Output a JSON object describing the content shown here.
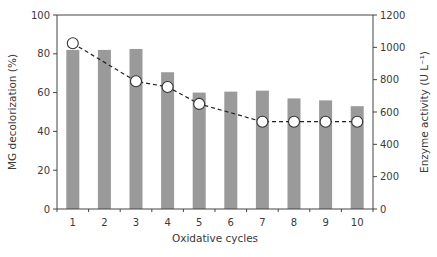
{
  "chart_data": {
    "type": "bar",
    "title": "",
    "xlabel": "Oxidative cycles",
    "ylabel": "MG decolorization (%)",
    "y2label": "Enzyme activity (U L⁻¹)",
    "categories": [
      "1",
      "2",
      "3",
      "4",
      "5",
      "6",
      "7",
      "8",
      "9",
      "10"
    ],
    "series": [
      {
        "name": "MG decolorization (%)",
        "type": "bar",
        "axis": "left",
        "color": "#9a9a9a",
        "values": [
          82,
          82,
          82.5,
          70.5,
          60,
          60.5,
          61,
          57,
          56,
          53
        ]
      },
      {
        "name": "Enzyme activity (U L⁻¹)",
        "type": "line",
        "axis": "right",
        "style": "dashed",
        "marker": "open-circle",
        "color": "#222222",
        "values": [
          1025,
          null,
          790,
          755,
          650,
          null,
          540,
          540,
          540,
          540
        ]
      }
    ],
    "ylim": [
      0,
      100
    ],
    "yticks": [
      0,
      20,
      40,
      60,
      80,
      100
    ],
    "y2lim": [
      0,
      1200
    ],
    "y2ticks": [
      0,
      200,
      400,
      600,
      800,
      1000,
      1200
    ],
    "grid": false,
    "legend": "none"
  }
}
